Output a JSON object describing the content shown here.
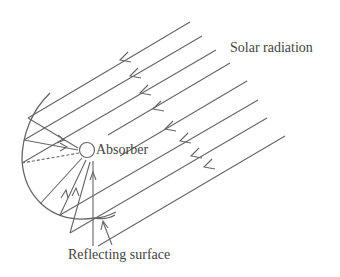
{
  "figure": {
    "labels": {
      "solar_radiation": "Solar radiation",
      "absorber": "Absorber",
      "reflecting_surface": "Reflecting surface"
    },
    "components": [
      "solar-radiation-rays",
      "absorber-tube",
      "parabolic-reflecting-surface",
      "reflected-rays"
    ],
    "colors": {
      "line": "#666666",
      "text": "#444444",
      "background": "#ffffff"
    }
  }
}
